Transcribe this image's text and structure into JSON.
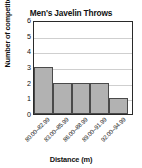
{
  "chart_data": {
    "type": "bar",
    "title": "Men's Javelin Throws",
    "xlabel": "Distance (m)",
    "ylabel": "Number of competitors",
    "categories": [
      "80.00–82.99",
      "83.00–85.99",
      "86.00–88.99",
      "89.00–91.99",
      "92.00–94.99"
    ],
    "values": [
      3,
      2,
      2,
      2,
      1
    ],
    "ylim": [
      0,
      6
    ],
    "yticks": [
      "0",
      "1",
      "2",
      "3",
      "4",
      "5",
      "6"
    ],
    "grid": true,
    "legend": "none",
    "bar_fill_color": "#b2b2b2",
    "bar_edge_color": "#4a4a4a",
    "axis_color": "#2a2a2a",
    "gridline_color": "#cfcfcf",
    "background_color": "#ffffff",
    "bars_touch": true
  }
}
